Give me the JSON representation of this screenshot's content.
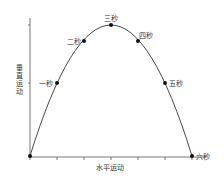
{
  "diagram": {
    "type": "projectile-trajectory",
    "x_axis_label": "水平运动",
    "y_axis_label": "垂直运动",
    "points": [
      {
        "label": "",
        "t": 0
      },
      {
        "label": "一秒",
        "t": 1
      },
      {
        "label": "二秒",
        "t": 2
      },
      {
        "label": "三秒",
        "t": 3
      },
      {
        "label": "四秒",
        "t": 4
      },
      {
        "label": "五秒",
        "t": 5
      },
      {
        "label": "六秒",
        "t": 6
      }
    ],
    "colors": {
      "line": "#333333",
      "point": "#111111",
      "axis": "#555555"
    }
  }
}
